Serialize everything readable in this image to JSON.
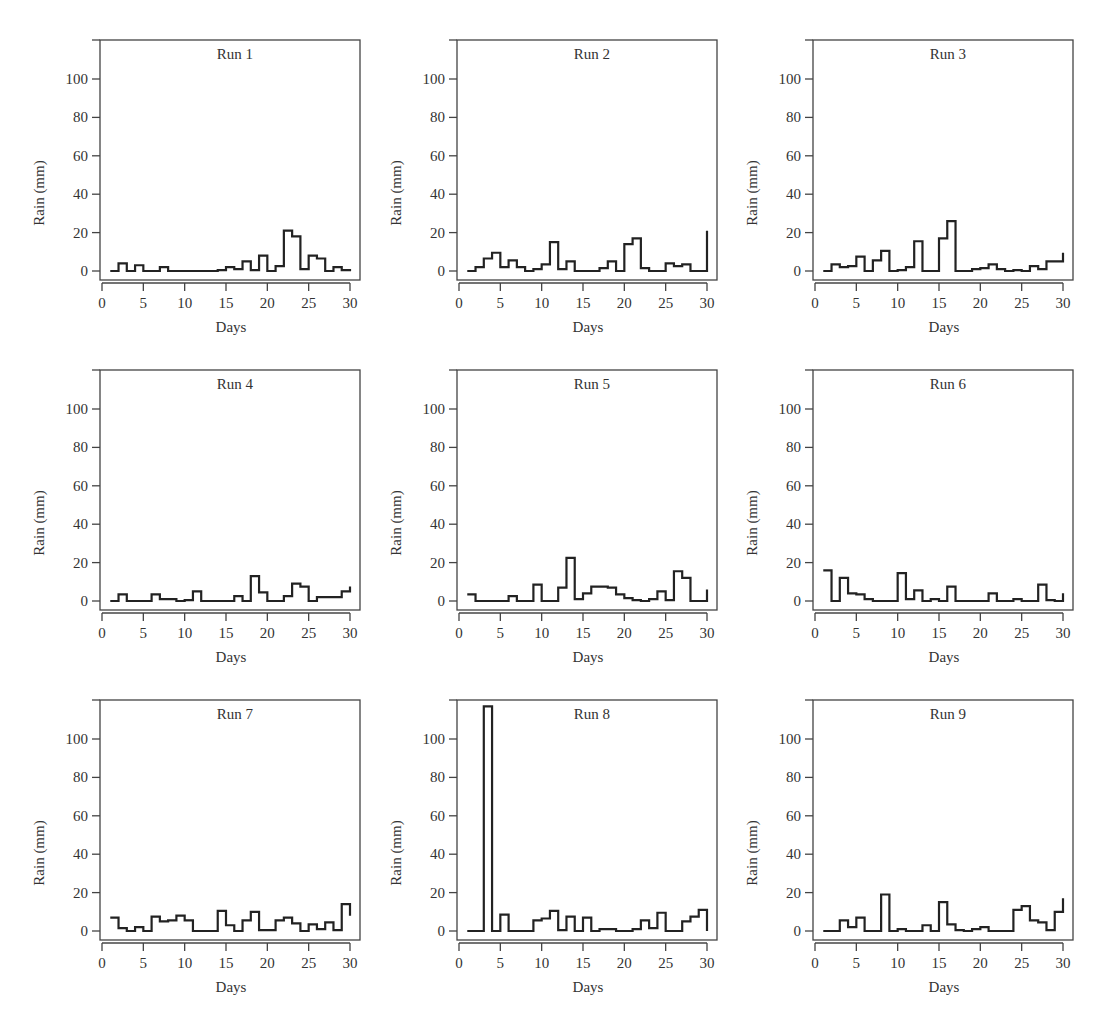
{
  "figure": {
    "panel_count": 9,
    "layout": {
      "rows": 3,
      "cols": 3
    },
    "line_color": "#222222"
  },
  "chart_data": [
    {
      "type": "line",
      "step": true,
      "title": "Run 1",
      "xlabel": "Days",
      "ylabel": "Rain (mm)",
      "xlim": [
        0,
        30
      ],
      "ylim": [
        -5,
        120
      ],
      "xticks": [
        0,
        5,
        10,
        15,
        20,
        25,
        30
      ],
      "yticks": [
        0,
        20,
        40,
        60,
        80,
        100
      ],
      "grid": false,
      "x": [
        1,
        2,
        3,
        4,
        5,
        6,
        7,
        8,
        9,
        10,
        11,
        12,
        13,
        14,
        15,
        16,
        17,
        18,
        19,
        20,
        21,
        22,
        23,
        24,
        25,
        26,
        27,
        28,
        29,
        30
      ],
      "values": [
        0,
        4,
        0,
        3,
        0,
        0,
        2,
        0,
        0,
        0,
        0,
        0,
        0,
        0.5,
        2,
        1,
        5,
        0.5,
        8,
        0,
        2.5,
        21,
        18,
        1,
        8,
        6.5,
        0,
        2,
        0.5,
        1
      ]
    },
    {
      "type": "line",
      "step": true,
      "title": "Run 2",
      "xlabel": "Days",
      "ylabel": "Rain (mm)",
      "xlim": [
        0,
        30
      ],
      "ylim": [
        -5,
        120
      ],
      "xticks": [
        0,
        5,
        10,
        15,
        20,
        25,
        30
      ],
      "yticks": [
        0,
        20,
        40,
        60,
        80,
        100
      ],
      "grid": false,
      "x": [
        1,
        2,
        3,
        4,
        5,
        6,
        7,
        8,
        9,
        10,
        11,
        12,
        13,
        14,
        15,
        16,
        17,
        18,
        19,
        20,
        21,
        22,
        23,
        24,
        25,
        26,
        27,
        28,
        29,
        30
      ],
      "values": [
        0,
        2,
        6.5,
        9.5,
        2,
        5.5,
        2,
        0,
        1,
        3.5,
        15,
        1,
        5,
        0,
        0,
        0,
        1.5,
        5,
        0,
        14,
        17,
        1.5,
        0,
        0,
        4,
        2.5,
        3.5,
        0,
        0,
        21
      ]
    },
    {
      "type": "line",
      "step": true,
      "title": "Run 3",
      "xlabel": "Days",
      "ylabel": "Rain (mm)",
      "xlim": [
        0,
        30
      ],
      "ylim": [
        -5,
        120
      ],
      "xticks": [
        0,
        5,
        10,
        15,
        20,
        25,
        30
      ],
      "yticks": [
        0,
        20,
        40,
        60,
        80,
        100
      ],
      "grid": false,
      "x": [
        1,
        2,
        3,
        4,
        5,
        6,
        7,
        8,
        9,
        10,
        11,
        12,
        13,
        14,
        15,
        16,
        17,
        18,
        19,
        20,
        21,
        22,
        23,
        24,
        25,
        26,
        27,
        28,
        29,
        30
      ],
      "values": [
        0,
        3.5,
        2,
        2.5,
        7.5,
        0,
        5.5,
        10.5,
        0,
        0.5,
        2,
        15.5,
        0,
        0,
        17,
        26,
        0,
        0,
        1,
        1.5,
        3.5,
        1,
        0,
        0.5,
        0,
        2.5,
        1,
        5,
        5,
        9.5
      ]
    },
    {
      "type": "line",
      "step": true,
      "title": "Run 4",
      "xlabel": "Days",
      "ylabel": "Rain (mm)",
      "xlim": [
        0,
        30
      ],
      "ylim": [
        -5,
        120
      ],
      "xticks": [
        0,
        5,
        10,
        15,
        20,
        25,
        30
      ],
      "yticks": [
        0,
        20,
        40,
        60,
        80,
        100
      ],
      "grid": false,
      "x": [
        1,
        2,
        3,
        4,
        5,
        6,
        7,
        8,
        9,
        10,
        11,
        12,
        13,
        14,
        15,
        16,
        17,
        18,
        19,
        20,
        21,
        22,
        23,
        24,
        25,
        26,
        27,
        28,
        29,
        30
      ],
      "values": [
        0,
        3.5,
        0,
        0,
        0,
        3.5,
        1,
        1,
        0,
        0.5,
        5,
        0,
        0,
        0,
        0,
        2.5,
        0,
        13,
        4.5,
        0,
        0,
        2.5,
        9,
        7.5,
        0,
        2,
        2,
        2,
        5,
        7.5
      ]
    },
    {
      "type": "line",
      "step": true,
      "title": "Run 5",
      "xlabel": "Days",
      "ylabel": "Rain (mm)",
      "xlim": [
        0,
        30
      ],
      "ylim": [
        -5,
        120
      ],
      "xticks": [
        0,
        5,
        10,
        15,
        20,
        25,
        30
      ],
      "yticks": [
        0,
        20,
        40,
        60,
        80,
        100
      ],
      "grid": false,
      "x": [
        1,
        2,
        3,
        4,
        5,
        6,
        7,
        8,
        9,
        10,
        11,
        12,
        13,
        14,
        15,
        16,
        17,
        18,
        19,
        20,
        21,
        22,
        23,
        24,
        25,
        26,
        27,
        28,
        29,
        30
      ],
      "values": [
        3.5,
        0,
        0,
        0,
        0,
        2.5,
        0,
        0,
        8.5,
        0,
        0,
        7,
        22.5,
        1,
        4,
        7.5,
        7.5,
        7,
        3.5,
        1.5,
        0.5,
        0,
        1,
        5,
        0.5,
        15.5,
        12,
        0,
        0,
        6
      ]
    },
    {
      "type": "line",
      "step": true,
      "title": "Run 6",
      "xlabel": "Days",
      "ylabel": "Rain (mm)",
      "xlim": [
        0,
        30
      ],
      "ylim": [
        -5,
        120
      ],
      "xticks": [
        0,
        5,
        10,
        15,
        20,
        25,
        30
      ],
      "yticks": [
        0,
        20,
        40,
        60,
        80,
        100
      ],
      "grid": false,
      "x": [
        1,
        2,
        3,
        4,
        5,
        6,
        7,
        8,
        9,
        10,
        11,
        12,
        13,
        14,
        15,
        16,
        17,
        18,
        19,
        20,
        21,
        22,
        23,
        24,
        25,
        26,
        27,
        28,
        29,
        30
      ],
      "values": [
        16,
        0,
        12,
        4,
        3.5,
        1,
        0,
        0,
        0,
        14.5,
        1,
        5.5,
        0,
        1,
        0,
        7.5,
        0,
        0,
        0,
        0,
        4,
        0,
        0,
        1,
        0,
        0,
        8.5,
        0.5,
        0,
        4
      ]
    },
    {
      "type": "line",
      "step": true,
      "title": "Run 7",
      "xlabel": "Days",
      "ylabel": "Rain (mm)",
      "xlim": [
        0,
        30
      ],
      "ylim": [
        -5,
        120
      ],
      "xticks": [
        0,
        5,
        10,
        15,
        20,
        25,
        30
      ],
      "yticks": [
        0,
        20,
        40,
        60,
        80,
        100
      ],
      "grid": false,
      "x": [
        1,
        2,
        3,
        4,
        5,
        6,
        7,
        8,
        9,
        10,
        11,
        12,
        13,
        14,
        15,
        16,
        17,
        18,
        19,
        20,
        21,
        22,
        23,
        24,
        25,
        26,
        27,
        28,
        29,
        30
      ],
      "values": [
        7,
        1.5,
        0,
        2,
        0,
        7.5,
        5,
        5.5,
        8,
        5.5,
        0,
        0,
        0,
        10.5,
        3,
        0,
        5.5,
        10,
        0.5,
        0.5,
        5.5,
        7,
        4,
        0,
        3.5,
        1,
        4.5,
        0.5,
        14,
        8
      ]
    },
    {
      "type": "line",
      "step": true,
      "title": "Run 8",
      "xlabel": "Days",
      "ylabel": "Rain (mm)",
      "xlim": [
        0,
        30
      ],
      "ylim": [
        -5,
        120
      ],
      "xticks": [
        0,
        5,
        10,
        15,
        20,
        25,
        30
      ],
      "yticks": [
        0,
        20,
        40,
        60,
        80,
        100
      ],
      "grid": false,
      "x": [
        1,
        2,
        3,
        4,
        5,
        6,
        7,
        8,
        9,
        10,
        11,
        12,
        13,
        14,
        15,
        16,
        17,
        18,
        19,
        20,
        21,
        22,
        23,
        24,
        25,
        26,
        27,
        28,
        29,
        30
      ],
      "values": [
        0,
        0,
        117,
        0,
        8.5,
        0,
        0,
        0,
        5.5,
        6.5,
        10.5,
        0.5,
        7.5,
        0,
        7,
        0,
        1,
        1,
        0,
        0,
        1,
        5.5,
        1.5,
        9.5,
        0,
        0,
        5,
        7.5,
        11,
        0
      ]
    },
    {
      "type": "line",
      "step": true,
      "title": "Run 9",
      "xlabel": "Days",
      "ylabel": "Rain (mm)",
      "xlim": [
        0,
        30
      ],
      "ylim": [
        -5,
        120
      ],
      "xticks": [
        0,
        5,
        10,
        15,
        20,
        25,
        30
      ],
      "yticks": [
        0,
        20,
        40,
        60,
        80,
        100
      ],
      "grid": false,
      "x": [
        1,
        2,
        3,
        4,
        5,
        6,
        7,
        8,
        9,
        10,
        11,
        12,
        13,
        14,
        15,
        16,
        17,
        18,
        19,
        20,
        21,
        22,
        23,
        24,
        25,
        26,
        27,
        28,
        29,
        30
      ],
      "values": [
        0,
        0,
        5.5,
        2,
        7,
        0,
        0,
        19,
        0,
        1,
        0,
        0,
        3,
        0,
        15,
        3.5,
        0.5,
        0,
        1,
        2,
        0,
        0,
        0,
        11,
        13,
        5.5,
        4.5,
        0.5,
        10,
        17
      ]
    }
  ]
}
